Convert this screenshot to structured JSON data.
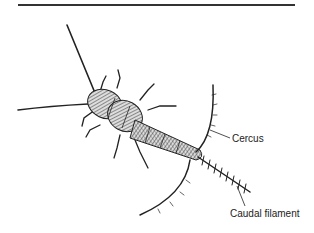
{
  "figure": {
    "labels": {
      "cercus": "Cercus",
      "caudal_filament": "Caudal filament"
    }
  },
  "colors": {
    "ink": "#222222",
    "rule": "#333333",
    "background": "#ffffff"
  }
}
